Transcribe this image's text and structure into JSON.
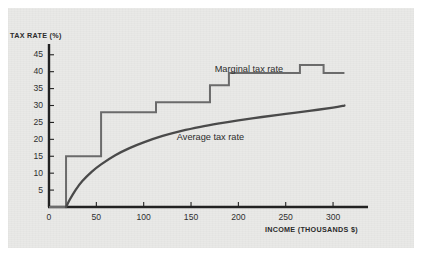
{
  "figure": {
    "background_color": "#e9e9e7",
    "page_color": "#ffffff"
  },
  "chart_data": {
    "type": "line",
    "title": "",
    "subtitle": "",
    "xlabel": "INCOME (THOUSANDS $)",
    "ylabel": "TAX RATE (%)",
    "xlim": [
      0,
      320
    ],
    "ylim": [
      0,
      47
    ],
    "xticks": [
      0,
      50,
      100,
      150,
      200,
      250,
      300
    ],
    "yticks": [
      5,
      10,
      15,
      20,
      25,
      30,
      35,
      40,
      45
    ],
    "xticklabels": [
      "0",
      "50",
      "100",
      "150",
      "200",
      "250",
      "300"
    ],
    "yticklabels": [
      "5",
      "10",
      "15",
      "20",
      "25",
      "30",
      "35",
      "40",
      "45"
    ],
    "grid": false,
    "legend_position": "inline-annotations",
    "series": [
      {
        "name": "Marginal tax rate",
        "kind": "step",
        "color": "#6b6b6b",
        "line_width": 2.0,
        "label_text": "Marginal tax rate",
        "brackets": [
          {
            "x_start": 0,
            "x_end": 18,
            "rate": 0.0
          },
          {
            "x_start": 18,
            "x_end": 55,
            "rate": 15.0
          },
          {
            "x_start": 55,
            "x_end": 113,
            "rate": 28.0
          },
          {
            "x_start": 113,
            "x_end": 170,
            "rate": 31.0
          },
          {
            "x_start": 170,
            "x_end": 190,
            "rate": 36.0
          },
          {
            "x_start": 190,
            "x_end": 265,
            "rate": 39.6
          },
          {
            "x_start": 265,
            "x_end": 290,
            "rate": 42.0
          },
          {
            "x_start": 290,
            "x_end": 312,
            "rate": 39.6
          }
        ]
      },
      {
        "name": "Average tax rate",
        "kind": "curve",
        "color": "#4a4a4a",
        "line_width": 2.3,
        "label_text": "Average tax rate",
        "points": [
          {
            "x": 18,
            "y": 0.0
          },
          {
            "x": 22,
            "y": 2.2
          },
          {
            "x": 28,
            "y": 5.0
          },
          {
            "x": 35,
            "y": 7.6
          },
          {
            "x": 45,
            "y": 10.4
          },
          {
            "x": 55,
            "y": 12.6
          },
          {
            "x": 70,
            "y": 15.3
          },
          {
            "x": 85,
            "y": 17.4
          },
          {
            "x": 100,
            "y": 19.1
          },
          {
            "x": 120,
            "y": 21.0
          },
          {
            "x": 140,
            "y": 22.5
          },
          {
            "x": 160,
            "y": 23.7
          },
          {
            "x": 180,
            "y": 24.7
          },
          {
            "x": 200,
            "y": 25.6
          },
          {
            "x": 225,
            "y": 26.6
          },
          {
            "x": 250,
            "y": 27.5
          },
          {
            "x": 275,
            "y": 28.4
          },
          {
            "x": 300,
            "y": 29.4
          },
          {
            "x": 312,
            "y": 30.0
          }
        ]
      }
    ],
    "annotations": [
      {
        "text": "Marginal tax rate",
        "x": 175,
        "y": 40.5
      },
      {
        "text": "Average tax rate",
        "x": 135,
        "y": 20.3
      }
    ]
  }
}
